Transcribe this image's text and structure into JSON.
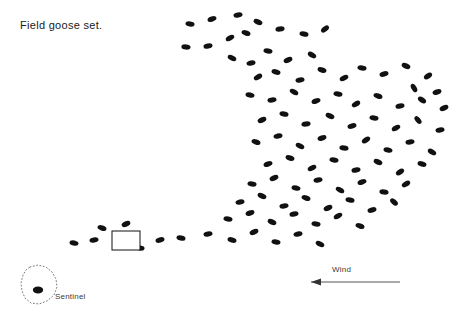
{
  "page": {
    "title": "Field goose set.",
    "background_color": "#ffffff"
  },
  "labels": {
    "sentinel": "Sentinel",
    "wind": "Wind"
  },
  "colors": {
    "decoy": "#111111",
    "text": "#1a1a1a",
    "label": "#3a3a3a",
    "sentinel_outline": "#7a7a7a",
    "wind": "#555555",
    "blind_stroke": "#111111",
    "blind_fill": "#ffffff"
  },
  "chart_data": {
    "type": "scatter",
    "title": "Field goose set.",
    "xlabel": "",
    "ylabel": "",
    "xlim": [
      0,
      464
    ],
    "ylim": [
      0,
      319
    ],
    "grid": false,
    "legend": "none",
    "annotations": [
      {
        "name": "title",
        "text": "Field goose set.",
        "x": 20,
        "y": 29
      },
      {
        "name": "sentinel-label",
        "text": "Sentinel",
        "x": 55,
        "y": 299
      },
      {
        "name": "wind-label",
        "text": "Wind",
        "x": 332,
        "y": 272
      }
    ],
    "blind": {
      "x": 112,
      "y": 231,
      "width": 28,
      "height": 19
    },
    "sentinel": {
      "dot": {
        "x": 38,
        "y": 290,
        "rx": 5.2,
        "ry": 3.4,
        "angle": 0
      },
      "outline_points": [
        [
          30,
          267
        ],
        [
          38,
          265
        ],
        [
          46,
          267
        ],
        [
          52,
          272
        ],
        [
          56,
          279
        ],
        [
          57,
          287
        ],
        [
          54,
          295
        ],
        [
          47,
          301
        ],
        [
          39,
          304
        ],
        [
          31,
          303
        ],
        [
          25,
          298
        ],
        [
          22,
          291
        ],
        [
          21,
          283
        ],
        [
          23,
          275
        ],
        [
          26,
          270
        ]
      ]
    },
    "wind_arrow": {
      "x_start": 400,
      "x_end": 311,
      "y": 282,
      "direction": "left",
      "head": [
        [
          311,
          282
        ],
        [
          321,
          278.6
        ],
        [
          321,
          285.4
        ]
      ]
    },
    "decoys": [
      {
        "x": 190,
        "y": 24,
        "a": 8
      },
      {
        "x": 212,
        "y": 19,
        "a": -18
      },
      {
        "x": 238,
        "y": 15,
        "a": -10
      },
      {
        "x": 258,
        "y": 22,
        "a": 22
      },
      {
        "x": 186,
        "y": 47,
        "a": 4
      },
      {
        "x": 208,
        "y": 46,
        "a": -12
      },
      {
        "x": 230,
        "y": 38,
        "a": -28
      },
      {
        "x": 246,
        "y": 33,
        "a": 18
      },
      {
        "x": 280,
        "y": 29,
        "a": -6
      },
      {
        "x": 304,
        "y": 34,
        "a": 12
      },
      {
        "x": 325,
        "y": 29,
        "a": -38
      },
      {
        "x": 232,
        "y": 58,
        "a": 26
      },
      {
        "x": 251,
        "y": 63,
        "a": -14
      },
      {
        "x": 268,
        "y": 51,
        "a": 10
      },
      {
        "x": 288,
        "y": 60,
        "a": -22
      },
      {
        "x": 312,
        "y": 55,
        "a": 30
      },
      {
        "x": 258,
        "y": 77,
        "a": -30
      },
      {
        "x": 276,
        "y": 72,
        "a": 16
      },
      {
        "x": 300,
        "y": 80,
        "a": -10
      },
      {
        "x": 322,
        "y": 70,
        "a": 20
      },
      {
        "x": 344,
        "y": 78,
        "a": -26
      },
      {
        "x": 362,
        "y": 68,
        "a": 8
      },
      {
        "x": 384,
        "y": 74,
        "a": -16
      },
      {
        "x": 406,
        "y": 66,
        "a": 24
      },
      {
        "x": 428,
        "y": 76,
        "a": -34
      },
      {
        "x": 414,
        "y": 88,
        "a": 60
      },
      {
        "x": 437,
        "y": 92,
        "a": -20
      },
      {
        "x": 250,
        "y": 95,
        "a": 14
      },
      {
        "x": 272,
        "y": 100,
        "a": -8
      },
      {
        "x": 294,
        "y": 92,
        "a": 28
      },
      {
        "x": 316,
        "y": 101,
        "a": -18
      },
      {
        "x": 338,
        "y": 94,
        "a": 10
      },
      {
        "x": 356,
        "y": 104,
        "a": -30
      },
      {
        "x": 378,
        "y": 96,
        "a": 18
      },
      {
        "x": 400,
        "y": 106,
        "a": -12
      },
      {
        "x": 422,
        "y": 100,
        "a": 34
      },
      {
        "x": 444,
        "y": 108,
        "a": -22
      },
      {
        "x": 262,
        "y": 120,
        "a": -24
      },
      {
        "x": 284,
        "y": 114,
        "a": 12
      },
      {
        "x": 306,
        "y": 124,
        "a": -6
      },
      {
        "x": 330,
        "y": 116,
        "a": 22
      },
      {
        "x": 352,
        "y": 126,
        "a": -16
      },
      {
        "x": 374,
        "y": 118,
        "a": 8
      },
      {
        "x": 396,
        "y": 128,
        "a": -28
      },
      {
        "x": 418,
        "y": 120,
        "a": 52
      },
      {
        "x": 440,
        "y": 130,
        "a": -10
      },
      {
        "x": 256,
        "y": 142,
        "a": 18
      },
      {
        "x": 278,
        "y": 136,
        "a": -14
      },
      {
        "x": 300,
        "y": 146,
        "a": 26
      },
      {
        "x": 322,
        "y": 138,
        "a": -20
      },
      {
        "x": 344,
        "y": 148,
        "a": 6
      },
      {
        "x": 366,
        "y": 140,
        "a": -32
      },
      {
        "x": 388,
        "y": 150,
        "a": 14
      },
      {
        "x": 410,
        "y": 142,
        "a": -8
      },
      {
        "x": 432,
        "y": 152,
        "a": 30
      },
      {
        "x": 268,
        "y": 164,
        "a": -18
      },
      {
        "x": 290,
        "y": 158,
        "a": 20
      },
      {
        "x": 312,
        "y": 168,
        "a": -26
      },
      {
        "x": 334,
        "y": 160,
        "a": 10
      },
      {
        "x": 356,
        "y": 170,
        "a": -12
      },
      {
        "x": 378,
        "y": 162,
        "a": 24
      },
      {
        "x": 400,
        "y": 172,
        "a": -34
      },
      {
        "x": 422,
        "y": 164,
        "a": 16
      },
      {
        "x": 252,
        "y": 184,
        "a": 8
      },
      {
        "x": 274,
        "y": 178,
        "a": -22
      },
      {
        "x": 296,
        "y": 188,
        "a": 14
      },
      {
        "x": 318,
        "y": 180,
        "a": -10
      },
      {
        "x": 340,
        "y": 190,
        "a": 28
      },
      {
        "x": 362,
        "y": 182,
        "a": -18
      },
      {
        "x": 384,
        "y": 192,
        "a": 6
      },
      {
        "x": 406,
        "y": 184,
        "a": -30
      },
      {
        "x": 240,
        "y": 202,
        "a": -14
      },
      {
        "x": 262,
        "y": 196,
        "a": 22
      },
      {
        "x": 284,
        "y": 206,
        "a": -8
      },
      {
        "x": 306,
        "y": 198,
        "a": 18
      },
      {
        "x": 328,
        "y": 208,
        "a": -24
      },
      {
        "x": 350,
        "y": 200,
        "a": 12
      },
      {
        "x": 372,
        "y": 210,
        "a": -16
      },
      {
        "x": 394,
        "y": 202,
        "a": 42
      },
      {
        "x": 228,
        "y": 219,
        "a": 10
      },
      {
        "x": 250,
        "y": 213,
        "a": -20
      },
      {
        "x": 272,
        "y": 222,
        "a": 24
      },
      {
        "x": 294,
        "y": 214,
        "a": -12
      },
      {
        "x": 316,
        "y": 224,
        "a": 8
      },
      {
        "x": 338,
        "y": 216,
        "a": -28
      },
      {
        "x": 360,
        "y": 226,
        "a": 18
      },
      {
        "x": 208,
        "y": 234,
        "a": -10
      },
      {
        "x": 232,
        "y": 240,
        "a": 16
      },
      {
        "x": 254,
        "y": 232,
        "a": -22
      },
      {
        "x": 276,
        "y": 242,
        "a": 10
      },
      {
        "x": 298,
        "y": 234,
        "a": -14
      },
      {
        "x": 320,
        "y": 244,
        "a": 26
      },
      {
        "x": 181,
        "y": 238,
        "a": 12
      },
      {
        "x": 160,
        "y": 240,
        "a": -16
      },
      {
        "x": 140,
        "y": 248,
        "a": 8
      },
      {
        "x": 126,
        "y": 224,
        "a": -24
      },
      {
        "x": 102,
        "y": 228,
        "a": 18
      },
      {
        "x": 94,
        "y": 240,
        "a": -10
      },
      {
        "x": 74,
        "y": 243,
        "a": 14
      }
    ]
  }
}
